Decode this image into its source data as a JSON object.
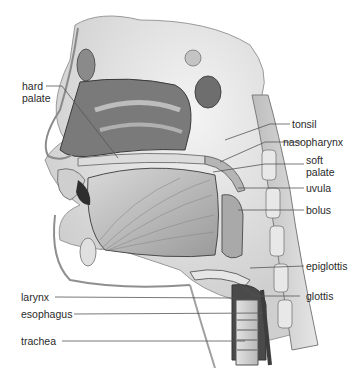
{
  "figure": {
    "labels": {
      "hard_palate": "hard\npalate",
      "tonsil": "tonsil",
      "nasopharynx": "nasopharynx",
      "soft_palate": "soft\npalate",
      "uvula": "uvula",
      "bolus": "bolus",
      "epiglottis": "epiglottis",
      "glottis": "glottis",
      "larynx": "larynx",
      "esophagus": "esophagus",
      "trachea": "trachea"
    }
  }
}
